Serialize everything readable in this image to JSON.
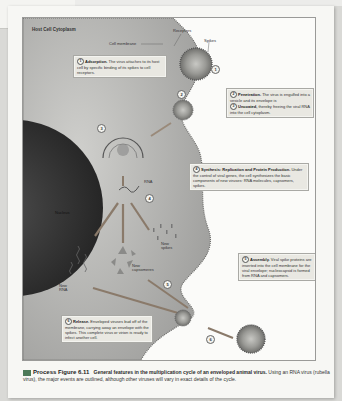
{
  "figure": {
    "regions": {
      "cytoplasm_label": "Host Cell Cytoplasm",
      "cell_membrane_label": "Cell membrane",
      "nucleus_label": "Nucleus",
      "receptors_label": "Receptors",
      "spikes_label": "Spikes",
      "rna_label": "RNA",
      "new_spikes_label": "New spikes",
      "new_capsomeres_label": "New capsomeres",
      "new_rna_label": "New RNA"
    },
    "steps": [
      {
        "num": "1",
        "title": "Adsorption.",
        "text": "The virus attaches to its host cell by specific binding of its spikes to cell receptors."
      },
      {
        "num": "2",
        "title": "Penetration.",
        "text": "The virus is engulfed into a vesicle and its envelope is"
      },
      {
        "num": "3",
        "title": "Uncoated,",
        "text": "thereby freeing the viral RNA into the cell cytoplasm."
      },
      {
        "num": "4",
        "title": "Synthesis: Replication and Protein Production.",
        "text": "Under the control of viral genes, the cell synthesizes the basic components of new viruses: RNA molecules, capsomers, spikes."
      },
      {
        "num": "5",
        "title": "Assembly.",
        "text": "Viral spike proteins are inserted into the cell membrane for the viral envelope; nucleocapsid is formed from RNA and capsomers."
      },
      {
        "num": "6",
        "title": "Release.",
        "text": "Enveloped viruses bud off of the membrane, carrying away an envelope with the spikes. This complete virus or virion is ready to infect another cell."
      }
    ],
    "markers": [
      "1",
      "2",
      "3",
      "4",
      "5",
      "6"
    ]
  },
  "caption": {
    "label": "Process Figure 6.11",
    "title": "General features in the multiplication cycle of an enveloped animal virus.",
    "text": "Using an RNA virus (rubella virus), the major events are outlined, although other viruses will vary in exact details of the cycle."
  },
  "colors": {
    "cytoplasm": "#a9a9a7",
    "nucleus": "#3a3a3a",
    "box_bg": "#e9e8e2",
    "caption_icon": "#4d7a58"
  }
}
